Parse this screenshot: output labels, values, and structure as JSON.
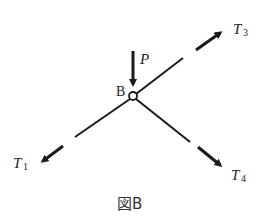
{
  "diagram": {
    "caption": "図B",
    "node": {
      "label": "B",
      "cx": 133,
      "cy": 96,
      "r": 4
    },
    "applied_load": {
      "label": "P",
      "direction": "down"
    },
    "forces": [
      {
        "id": "T1",
        "symbol": "T",
        "subscript": "1",
        "direction": "lower-left"
      },
      {
        "id": "T3",
        "symbol": "T",
        "subscript": "3",
        "direction": "upper-right"
      },
      {
        "id": "T4",
        "symbol": "T",
        "subscript": "4",
        "direction": "lower-right"
      }
    ],
    "colors": {
      "line": "#1a1a1a",
      "background": "#ffffff"
    }
  }
}
